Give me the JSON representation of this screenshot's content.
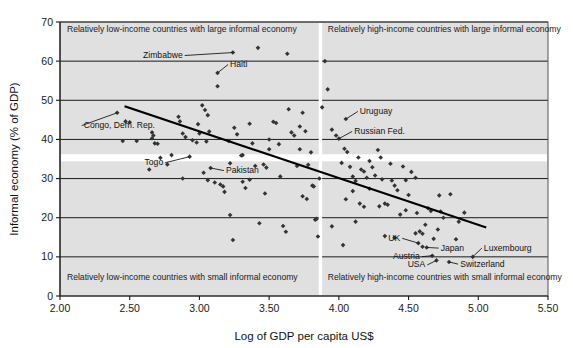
{
  "chart_data": {
    "type": "scatter",
    "title": "",
    "xlabel": "Log of GDP per capita US$",
    "ylabel": "Informal economy (% of GDP)",
    "xlim": [
      2.0,
      5.5
    ],
    "ylim": [
      0,
      70
    ],
    "xticks": [
      "2.00",
      "2.50",
      "3.00",
      "3.50",
      "4.00",
      "4.50",
      "5.00",
      "5.50"
    ],
    "xtick_values": [
      2.0,
      2.5,
      3.0,
      3.5,
      4.0,
      4.5,
      5.0,
      5.5
    ],
    "yticks": [
      "0",
      "10",
      "20",
      "30",
      "40",
      "50",
      "60",
      "70"
    ],
    "ytick_values": [
      0,
      10,
      20,
      30,
      40,
      50,
      60,
      70
    ],
    "grid": "horizontal",
    "legend": "none",
    "quadrant_divider_x": 3.87,
    "quadrant_labels": [
      {
        "text": "Relatively low-income countries with large informal economy",
        "x": 2.05,
        "y": 67.5,
        "anchor": "start"
      },
      {
        "text": "Relatively high-income countries with large informal economy",
        "x": 3.92,
        "y": 67.5,
        "anchor": "start"
      },
      {
        "text": "Relatively low-income countries with small informal economy",
        "x": 2.05,
        "y": 4.2,
        "anchor": "start"
      },
      {
        "text": "Relatively high-income countries with small informal economy",
        "x": 3.92,
        "y": 4.2,
        "anchor": "start"
      }
    ],
    "trendline": {
      "x1": 2.47,
      "y1": 48.4,
      "x2": 5.05,
      "y2": 17.6
    },
    "annotations": [
      {
        "label": "Zimbabwe",
        "text_x": 2.88,
        "text_y": 60.8,
        "point_x": 3.24,
        "point_y": 62.2,
        "anchor": "end"
      },
      {
        "label": "Haiti",
        "text_x": 3.22,
        "text_y": 58.5,
        "point_x": 3.13,
        "point_y": 57.0,
        "anchor": "start"
      },
      {
        "label": "Congo, Dem. Rep.",
        "text_x": 2.17,
        "text_y": 42.9,
        "point_x": 2.41,
        "point_y": 46.8,
        "anchor": "start"
      },
      {
        "label": "Togo",
        "text_x": 2.74,
        "text_y": 33.4,
        "point_x": 2.93,
        "point_y": 35.6,
        "anchor": "end"
      },
      {
        "label": "Pakistan",
        "text_x": 3.19,
        "text_y": 31.4,
        "point_x": 3.08,
        "point_y": 32.7,
        "anchor": "start"
      },
      {
        "label": "Uruguay",
        "text_x": 4.15,
        "text_y": 46.5,
        "point_x": 4.05,
        "point_y": 45.2,
        "anchor": "start"
      },
      {
        "label": "Russian Fed.",
        "text_x": 4.11,
        "text_y": 41.4,
        "point_x": 4.0,
        "point_y": 40.2,
        "anchor": "start"
      },
      {
        "label": "UK",
        "text_x": 4.44,
        "text_y": 14.1,
        "point_x": 4.57,
        "point_y": 13.5,
        "anchor": "end"
      },
      {
        "label": "Japan",
        "text_x": 4.73,
        "text_y": 11.6,
        "point_x": 4.63,
        "point_y": 12.4,
        "anchor": "start"
      },
      {
        "label": "Luxembourg",
        "text_x": 5.04,
        "text_y": 11.6,
        "point_x": 4.96,
        "point_y": 10.0,
        "anchor": "start"
      },
      {
        "label": "Austria",
        "text_x": 4.58,
        "text_y": 9.4,
        "point_x": 4.67,
        "point_y": 10.3,
        "anchor": "end"
      },
      {
        "label": "USA",
        "text_x": 4.62,
        "text_y": 7.3,
        "point_x": 4.7,
        "point_y": 9.1,
        "anchor": "end"
      },
      {
        "label": "Switzerland",
        "text_x": 4.87,
        "text_y": 7.5,
        "point_x": 4.79,
        "point_y": 8.7,
        "anchor": "start"
      }
    ],
    "points": [
      [
        2.41,
        46.8
      ],
      [
        2.45,
        39.6
      ],
      [
        2.55,
        39.6
      ],
      [
        2.47,
        44.6
      ],
      [
        2.5,
        44.4
      ],
      [
        2.66,
        41.8
      ],
      [
        2.67,
        41.0
      ],
      [
        2.66,
        40.3
      ],
      [
        2.68,
        39.0
      ],
      [
        2.7,
        38.9
      ],
      [
        2.72,
        35.3
      ],
      [
        2.77,
        33.6
      ],
      [
        2.64,
        32.3
      ],
      [
        2.8,
        36.0
      ],
      [
        2.85,
        45.8
      ],
      [
        2.86,
        44.6
      ],
      [
        2.88,
        41.5
      ],
      [
        2.9,
        40.6
      ],
      [
        2.93,
        35.6
      ],
      [
        2.95,
        39.8
      ],
      [
        2.98,
        39.2
      ],
      [
        2.99,
        43.9
      ],
      [
        3.0,
        41.5
      ],
      [
        3.02,
        48.7
      ],
      [
        3.04,
        47.5
      ],
      [
        3.06,
        46.2
      ],
      [
        3.07,
        42.0
      ],
      [
        3.05,
        39.5
      ],
      [
        3.03,
        31.5
      ],
      [
        3.08,
        32.7
      ],
      [
        3.06,
        29.6
      ],
      [
        3.11,
        29.0
      ],
      [
        3.13,
        57.0
      ],
      [
        3.13,
        53.6
      ],
      [
        3.15,
        28.5
      ],
      [
        3.17,
        28.0
      ],
      [
        3.18,
        26.6
      ],
      [
        3.21,
        39.6
      ],
      [
        3.22,
        33.9
      ],
      [
        3.22,
        20.7
      ],
      [
        3.24,
        62.2
      ],
      [
        3.24,
        14.3
      ],
      [
        3.25,
        43.0
      ],
      [
        3.27,
        41.3
      ],
      [
        3.3,
        35.9
      ],
      [
        3.31,
        29.2
      ],
      [
        3.33,
        27.6
      ],
      [
        3.36,
        44.0
      ],
      [
        3.38,
        39.0
      ],
      [
        3.4,
        33.2
      ],
      [
        3.42,
        63.4
      ],
      [
        3.43,
        18.6
      ],
      [
        3.46,
        33.6
      ],
      [
        3.48,
        32.8
      ],
      [
        3.5,
        37.5
      ],
      [
        3.53,
        44.5
      ],
      [
        3.55,
        44.2
      ],
      [
        3.57,
        38.8
      ],
      [
        3.58,
        30.5
      ],
      [
        3.6,
        17.9
      ],
      [
        3.62,
        16.4
      ],
      [
        3.63,
        61.9
      ],
      [
        3.64,
        47.7
      ],
      [
        3.66,
        41.8
      ],
      [
        3.68,
        41.0
      ],
      [
        3.7,
        33.2
      ],
      [
        3.72,
        43.3
      ],
      [
        3.74,
        46.8
      ],
      [
        3.76,
        42.1
      ],
      [
        3.78,
        33.5
      ],
      [
        3.8,
        36.7
      ],
      [
        3.81,
        28.2
      ],
      [
        3.82,
        28.0
      ],
      [
        3.83,
        19.5
      ],
      [
        3.84,
        19.7
      ],
      [
        3.85,
        15.2
      ],
      [
        3.86,
        30.0
      ],
      [
        3.72,
        37.5
      ],
      [
        3.74,
        25.5
      ],
      [
        3.77,
        24.8
      ],
      [
        3.9,
        60.0
      ],
      [
        3.92,
        52.8
      ],
      [
        3.95,
        42.5
      ],
      [
        3.98,
        41.0
      ],
      [
        4.0,
        40.2
      ],
      [
        4.02,
        34.0
      ],
      [
        4.05,
        45.2
      ],
      [
        4.04,
        37.6
      ],
      [
        4.06,
        36.8
      ],
      [
        4.08,
        33.0
      ],
      [
        4.1,
        30.5
      ],
      [
        4.12,
        29.4
      ],
      [
        4.1,
        26.8
      ],
      [
        4.14,
        35.4
      ],
      [
        4.16,
        32.3
      ],
      [
        4.18,
        31.8
      ],
      [
        4.2,
        30.2
      ],
      [
        4.15,
        23.6
      ],
      [
        4.18,
        22.8
      ],
      [
        4.22,
        34.5
      ],
      [
        4.24,
        32.9
      ],
      [
        4.26,
        30.8
      ],
      [
        4.22,
        27.4
      ],
      [
        4.28,
        37.3
      ],
      [
        4.3,
        35.4
      ],
      [
        4.31,
        29.8
      ],
      [
        4.33,
        23.6
      ],
      [
        4.35,
        23.3
      ],
      [
        4.29,
        22.9
      ],
      [
        4.37,
        33.8
      ],
      [
        4.38,
        29.5
      ],
      [
        4.4,
        28.2
      ],
      [
        4.42,
        27.0
      ],
      [
        4.44,
        20.8
      ],
      [
        4.46,
        33.1
      ],
      [
        4.48,
        29.6
      ],
      [
        4.5,
        25.8
      ],
      [
        4.52,
        31.7
      ],
      [
        4.55,
        30.2
      ],
      [
        4.57,
        13.5
      ],
      [
        4.55,
        16.0
      ],
      [
        4.58,
        16.5
      ],
      [
        4.6,
        15.9
      ],
      [
        4.62,
        18.2
      ],
      [
        4.6,
        12.6
      ],
      [
        4.63,
        12.4
      ],
      [
        4.64,
        22.4
      ],
      [
        4.66,
        21.7
      ],
      [
        4.67,
        10.3
      ],
      [
        4.68,
        14.6
      ],
      [
        4.7,
        9.1
      ],
      [
        4.71,
        17.0
      ],
      [
        4.73,
        21.6
      ],
      [
        4.75,
        20.0
      ],
      [
        4.72,
        25.7
      ],
      [
        4.79,
        8.7
      ],
      [
        4.8,
        26.0
      ],
      [
        4.84,
        14.5
      ],
      [
        4.86,
        19.0
      ],
      [
        4.9,
        21.3
      ],
      [
        4.96,
        10.0
      ],
      [
        4.33,
        15.3
      ],
      [
        4.4,
        14.9
      ],
      [
        3.5,
        40.0
      ],
      [
        3.31,
        36.0
      ],
      [
        2.88,
        30.0
      ],
      [
        3.47,
        26.2
      ],
      [
        4.05,
        24.7
      ],
      [
        4.12,
        19.0
      ],
      [
        3.95,
        17.8
      ],
      [
        4.03,
        13.0
      ],
      [
        3.36,
        29.7
      ],
      [
        3.88,
        48.2
      ],
      [
        4.48,
        21.9
      ],
      [
        4.56,
        21.2
      ]
    ]
  }
}
